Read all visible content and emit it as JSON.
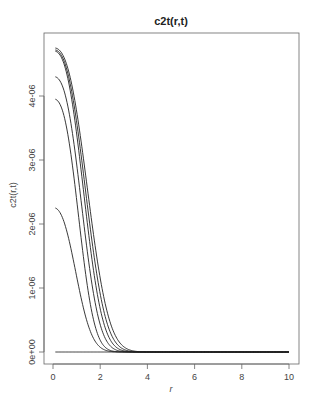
{
  "chart_data": {
    "type": "line",
    "title": "c2t(r,t)",
    "xlabel": "r",
    "ylabel": "c2t(r,t)",
    "xlim": [
      0,
      10
    ],
    "ylim": [
      0,
      4.9e-06
    ],
    "x_ticks": [
      0,
      2,
      4,
      6,
      8,
      10
    ],
    "x_tick_labels": [
      "0",
      "2",
      "4",
      "6",
      "8",
      "10"
    ],
    "y_ticks": [
      0,
      1e-06,
      2e-06,
      3e-06,
      4e-06
    ],
    "y_tick_labels": [
      "0e+00",
      "1e-06",
      "2e-06",
      "3e-06",
      "4e-06"
    ],
    "grid": false,
    "legend": null,
    "r_start": 0.1,
    "r_end": 10,
    "series": [
      {
        "name": "t1",
        "peak": 4.75e-06,
        "scale": 1.75,
        "shape": 2.6,
        "description": "highest curve; starts ~4.75e-06 at r=0.1, ~0 by r~2.5"
      },
      {
        "name": "t2",
        "peak": 4.72e-06,
        "scale": 1.65,
        "shape": 2.6,
        "description": "starts ~4.72e-06, ~0 by r~2.4"
      },
      {
        "name": "t3",
        "peak": 4.7e-06,
        "scale": 1.55,
        "shape": 2.6,
        "description": "starts ~4.7e-06, ~0 by r~2.3"
      },
      {
        "name": "t4",
        "peak": 4.3e-06,
        "scale": 1.45,
        "shape": 2.6,
        "description": "starts ~4.3e-06, ~0 by r~2.3"
      },
      {
        "name": "t5",
        "peak": 3.95e-06,
        "scale": 1.3,
        "shape": 2.6,
        "description": "starts ~3.95e-06, ~0 by r~2.2"
      },
      {
        "name": "t6",
        "peak": 2.25e-06,
        "scale": 1.2,
        "shape": 2.4,
        "description": "starts ~2.25e-06, ~0 by r~2.2"
      },
      {
        "name": "t0",
        "peak": 0,
        "scale": 1,
        "shape": 2,
        "description": "flat line at 0 across r in [0.1, 10]"
      }
    ],
    "sample_points": {
      "r": [
        0.1,
        0.5,
        1.0,
        1.5,
        2.0,
        2.5,
        4,
        6,
        8,
        10
      ],
      "t1": [
        4.75e-06,
        4.7e-06,
        4.3e-06,
        3e-06,
        1e-06,
        5e-08,
        0,
        0,
        0,
        0
      ],
      "t6": [
        2.25e-06,
        2.05e-06,
        1.2e-06,
        3.5e-07,
        3e-08,
        0,
        0,
        0,
        0,
        0
      ]
    }
  }
}
